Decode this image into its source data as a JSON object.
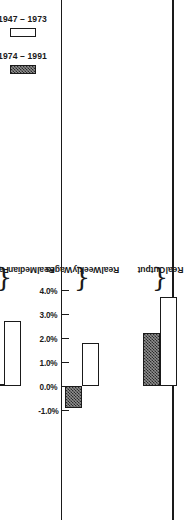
{
  "chart_data": {
    "type": "bar",
    "orientation": "horizontal",
    "title": "",
    "xlabel": "",
    "ylabel": "",
    "categories": [
      "Real Output",
      "Real Weekly Wages",
      "Real Median Family Income",
      "Real Per Capita Disposable Income",
      "Ouput Per Hour Per Employed Worker",
      "Output Per Year Per Employed Worker"
    ],
    "category_lines": [
      [
        "Real",
        "Output"
      ],
      [
        "Real",
        "Weekly",
        "Wages"
      ],
      [
        "Real",
        "Median",
        "Family",
        "Income"
      ],
      [
        "Real Per",
        "Capita",
        "Disposable",
        "Income"
      ],
      [
        "Ouput Per",
        "Hour Per",
        "Employed",
        "Worker"
      ],
      [
        "Output Per",
        "Year Per",
        "Employed",
        "Worker"
      ]
    ],
    "series": [
      {
        "name": "1947 – 1973",
        "values": [
          3.7,
          1.8,
          2.7,
          2.6,
          2.5,
          2.1
        ]
      },
      {
        "name": "1974 – 1991",
        "values": [
          2.2,
          -0.9,
          0.1,
          1.3,
          0.65,
          0.6
        ]
      }
    ],
    "xlim": [
      -1.0,
      4.0
    ],
    "ticks": [
      4.0,
      3.0,
      2.0,
      1.0,
      0.0,
      -1.0
    ],
    "tick_labels": [
      "4.0%",
      "3.0%",
      "2.0%",
      "1.0%",
      "0.0%",
      "-1.0%"
    ],
    "grid": false,
    "legend_position": "right",
    "colors": {
      "series_1947_1973": "#ffffff",
      "series_1974_1991": "#555555",
      "axis": "#1a1a1a",
      "background": "#ffffff"
    }
  },
  "legend": {
    "items": [
      {
        "label": "1947 – 1973",
        "swatch": "hollow-swatch"
      },
      {
        "label": "1974 – 1991",
        "swatch": "hatched-swatch"
      }
    ]
  }
}
